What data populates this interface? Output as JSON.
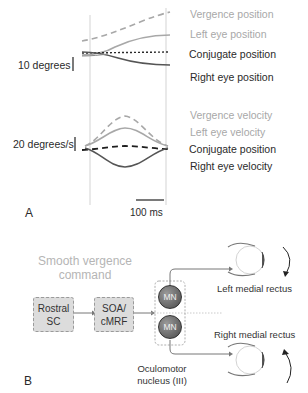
{
  "panel_a": {
    "label": "A",
    "position_scale": "10 degrees",
    "velocity_scale": "20 degrees/s",
    "time_scale": "100 ms",
    "position_legend": [
      {
        "label": "Vergence position",
        "color": "#a8a8a8",
        "style": "dashed"
      },
      {
        "label": "Left eye position",
        "color": "#a8a8a8",
        "style": "solid"
      },
      {
        "label": "Conjugate position",
        "color": "#2a2a2a",
        "style": "dotted"
      },
      {
        "label": "Right eye position",
        "color": "#555555",
        "style": "solid"
      }
    ],
    "velocity_legend": [
      {
        "label": "Vergence velocity",
        "color": "#a8a8a8",
        "style": "dashed"
      },
      {
        "label": "Left eye velocity",
        "color": "#a8a8a8",
        "style": "solid"
      },
      {
        "label": "Conjugate position",
        "color": "#2a2a2a",
        "style": "dashed"
      },
      {
        "label": "Right eye velocity",
        "color": "#555555",
        "style": "solid"
      }
    ]
  },
  "panel_b": {
    "label": "B",
    "title_line1": "Smooth vergence",
    "title_line2": "command",
    "box1_line1": "Rostral",
    "box1_line2": "SC",
    "box2_line1": "SOA/",
    "box2_line2": "cMRF",
    "mn_top": "MN",
    "mn_bottom": "MN",
    "nucleus_line1": "Oculomotor",
    "nucleus_line2": "nucleus (III)",
    "left_muscle": "Left medial rectus",
    "right_muscle": "Right medial rectus"
  }
}
